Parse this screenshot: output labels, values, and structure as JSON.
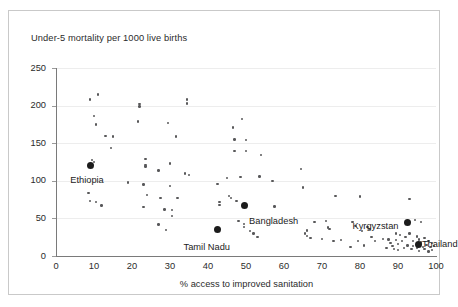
{
  "chart_data": {
    "type": "scatter",
    "title": "Under-5 mortality per 1000 live births",
    "xlabel": "% access to improved sanitation",
    "ylabel": "Under-5 mortality per 1000 live births",
    "xlim": [
      0,
      100
    ],
    "ylim": [
      0,
      250
    ],
    "xticks": [
      "0",
      "10",
      "20",
      "30",
      "40",
      "50",
      "60",
      "70",
      "80",
      "90",
      "100"
    ],
    "yticks": [
      "0",
      "50",
      "100",
      "150",
      "200",
      "250"
    ],
    "grid": "horizontal",
    "legend": "none",
    "marker_color": "#58585a",
    "highlight_color": "#1c1c1c",
    "points": [
      [
        9,
        208
      ],
      [
        11,
        215
      ],
      [
        10,
        186
      ],
      [
        10.5,
        175
      ],
      [
        13,
        160
      ],
      [
        15,
        159
      ],
      [
        14.5,
        144
      ],
      [
        9.5,
        128
      ],
      [
        10,
        125
      ],
      [
        8.5,
        84
      ],
      [
        9,
        73
      ],
      [
        10.5,
        72
      ],
      [
        12,
        67
      ],
      [
        19,
        98
      ],
      [
        22,
        202
      ],
      [
        22,
        199
      ],
      [
        21.5,
        179
      ],
      [
        23.5,
        129
      ],
      [
        23.5,
        121
      ],
      [
        23.5,
        119
      ],
      [
        23,
        95
      ],
      [
        24,
        81
      ],
      [
        23,
        65
      ],
      [
        27,
        42
      ],
      [
        27,
        114
      ],
      [
        27.5,
        77
      ],
      [
        28.5,
        62
      ],
      [
        29,
        35
      ],
      [
        29.5,
        177
      ],
      [
        30,
        123
      ],
      [
        30,
        93
      ],
      [
        30.5,
        61
      ],
      [
        30.5,
        53
      ],
      [
        31.5,
        159
      ],
      [
        32,
        77
      ],
      [
        34,
        110
      ],
      [
        34.5,
        208
      ],
      [
        34.5,
        203
      ],
      [
        35,
        108
      ],
      [
        42.5,
        96
      ],
      [
        43,
        72
      ],
      [
        43,
        68
      ],
      [
        45,
        104
      ],
      [
        45.5,
        80
      ],
      [
        46,
        77
      ],
      [
        46.5,
        171
      ],
      [
        47,
        155
      ],
      [
        47,
        140
      ],
      [
        47.5,
        73
      ],
      [
        48,
        47
      ],
      [
        48.5,
        105
      ],
      [
        49,
        182
      ],
      [
        49.5,
        43
      ],
      [
        49.5,
        39
      ],
      [
        50,
        154
      ],
      [
        50,
        140
      ],
      [
        51,
        33
      ],
      [
        52,
        30
      ],
      [
        53,
        25
      ],
      [
        53.5,
        106
      ],
      [
        54,
        134
      ],
      [
        57,
        100
      ],
      [
        57.5,
        66
      ],
      [
        64.5,
        116
      ],
      [
        65,
        91
      ],
      [
        65.5,
        30
      ],
      [
        66,
        34
      ],
      [
        66,
        27
      ],
      [
        67,
        24
      ],
      [
        68,
        45
      ],
      [
        70,
        23
      ],
      [
        71,
        47
      ],
      [
        71.5,
        38
      ],
      [
        72,
        36
      ],
      [
        73,
        20
      ],
      [
        73.5,
        80
      ],
      [
        75,
        21
      ],
      [
        77.5,
        12
      ],
      [
        78,
        45
      ],
      [
        79,
        40
      ],
      [
        79.5,
        20
      ],
      [
        80,
        79
      ],
      [
        80.5,
        33
      ],
      [
        81,
        14
      ],
      [
        82,
        39
      ],
      [
        82.5,
        36
      ],
      [
        83,
        25
      ],
      [
        84,
        20
      ],
      [
        86,
        23
      ],
      [
        87,
        11
      ],
      [
        87.5,
        22
      ],
      [
        88,
        17
      ],
      [
        88.5,
        13
      ],
      [
        89,
        9
      ],
      [
        89.5,
        30
      ],
      [
        89.5,
        21
      ],
      [
        90,
        16
      ],
      [
        90,
        8
      ],
      [
        90.5,
        28
      ],
      [
        91,
        20
      ],
      [
        91.5,
        11
      ],
      [
        92,
        25
      ],
      [
        92.5,
        14
      ],
      [
        93,
        76
      ],
      [
        93,
        30
      ],
      [
        93.5,
        9
      ],
      [
        94,
        20
      ],
      [
        94,
        13
      ],
      [
        94.5,
        48
      ],
      [
        95,
        26
      ],
      [
        95,
        11
      ],
      [
        95.5,
        22
      ],
      [
        95.5,
        7
      ],
      [
        96,
        45
      ],
      [
        96,
        18
      ],
      [
        96.5,
        12
      ],
      [
        97,
        24
      ],
      [
        97,
        9
      ],
      [
        97.5,
        15
      ],
      [
        98,
        20
      ],
      [
        98,
        6
      ],
      [
        98.5,
        12
      ],
      [
        99,
        17
      ],
      [
        99,
        8
      ],
      [
        99.5,
        13
      ]
    ],
    "highlights": [
      {
        "label": "Ethiopia",
        "x": 9,
        "y": 121,
        "label_dx": -20,
        "label_dy": 10
      },
      {
        "label": "Tamil Nadu",
        "x": 42.5,
        "y": 35,
        "label_dx": -34,
        "label_dy": 12
      },
      {
        "label": "Bangladesh",
        "x": 49.5,
        "y": 67,
        "label_dx": 5,
        "label_dy": 10
      },
      {
        "label": "Kyrgyzstan",
        "x": 92.5,
        "y": 44,
        "label_dx": -55,
        "label_dy": -2
      },
      {
        "label": "Thailand",
        "x": 95.5,
        "y": 16,
        "label_dx": 3,
        "label_dy": -5
      }
    ]
  }
}
